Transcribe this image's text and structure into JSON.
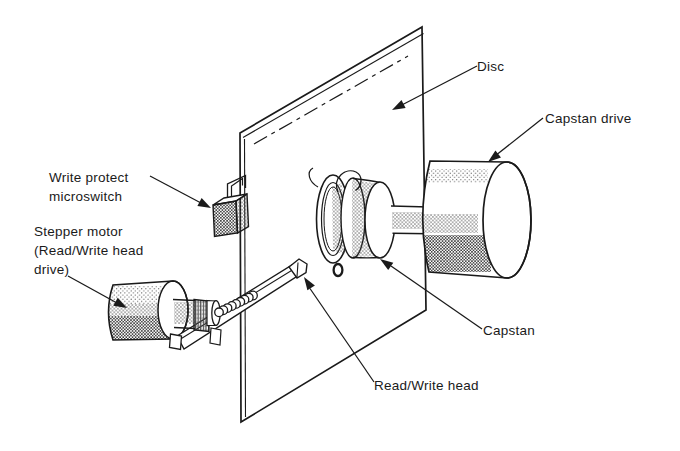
{
  "labels": {
    "disc": "Disc",
    "capstan_drive": "Capstan drive",
    "write_protect": {
      "line1": "Write protect",
      "line2": "microswitch"
    },
    "stepper_motor": {
      "line1": "Stepper motor",
      "line2": "(Read/Write head",
      "line3": "drive)"
    },
    "capstan": "Capstan",
    "read_write_head": "Read/Write head"
  },
  "colors": {
    "ink": "#1a1a1a",
    "paper": "#ffffff"
  }
}
